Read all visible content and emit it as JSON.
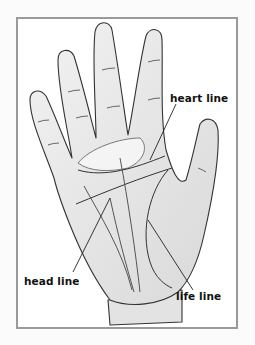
{
  "diagram": {
    "labels": {
      "heart_line": "heart line",
      "head_line": "head line",
      "life_line": "life line"
    },
    "colors": {
      "frame_border": "#9a9a9a",
      "skin": "#e6e6e6",
      "outline": "#333333",
      "background": "#ffffff"
    }
  }
}
